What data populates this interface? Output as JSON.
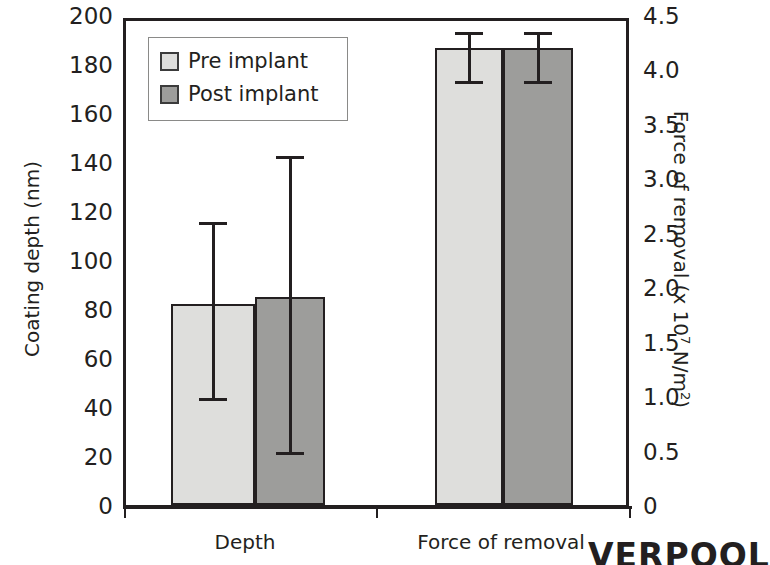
{
  "chart_data": {
    "type": "bar",
    "title": "",
    "categories": [
      "Depth",
      "Force of removal"
    ],
    "series": [
      {
        "name": "Pre implant",
        "values": [
          82,
          4.2
        ],
        "color": "#dededc",
        "errors_low": [
          46,
          3.95
        ],
        "errors_high": [
          118,
          4.4
        ]
      },
      {
        "name": "Post implant",
        "values": [
          85,
          4.2
        ],
        "color": "#9d9d9b",
        "errors_low": [
          24,
          3.95
        ],
        "errors_high": [
          145,
          4.4
        ]
      }
    ],
    "axes": {
      "left": {
        "label": "Coating depth (nm)",
        "ticks": [
          "200",
          "180",
          "160",
          "140",
          "120",
          "100",
          "80",
          "60",
          "40",
          "20",
          "0"
        ],
        "ylim": [
          0,
          200
        ],
        "applies_to": "Depth"
      },
      "right": {
        "label": "Force of removal (x 10",
        "label_sup": "7",
        "label_tail": " N/m",
        "label_tail_sup": "2",
        "label_close": ")",
        "ticks": [
          "4.5",
          "4.0",
          "3.5",
          "3.0",
          "2.5",
          "2.0",
          "1.5",
          "1.0",
          "0.5",
          "0"
        ],
        "ylim": [
          0,
          4.5
        ],
        "applies_to": "Force of removal"
      }
    },
    "legend": {
      "position": "top-left",
      "entries": [
        "Pre implant",
        "Post implant"
      ]
    },
    "grid": false
  },
  "legend": {
    "pre_label": "Pre implant",
    "post_label": "Post implant",
    "pre_color": "#dededc",
    "post_color": "#9d9d9b"
  },
  "axes": {
    "left_title": "Coating depth (nm)",
    "right_title_head": "Force of removal (x 10",
    "right_title_sup": "7",
    "right_title_mid": " N/m",
    "right_title_sup2": "2",
    "right_title_end": ")",
    "left_ticks": [
      "200",
      "180",
      "160",
      "140",
      "120",
      "100",
      "80",
      "60",
      "40",
      "20",
      "0"
    ],
    "right_ticks": [
      "4.5",
      "4.0",
      "3.5",
      "3.0",
      "2.5",
      "2.0",
      "1.5",
      "1.0",
      "0.5",
      "0"
    ]
  },
  "categories": {
    "depth": "Depth",
    "force": "Force of removal"
  },
  "artifact": {
    "text": "VERPOOL"
  }
}
